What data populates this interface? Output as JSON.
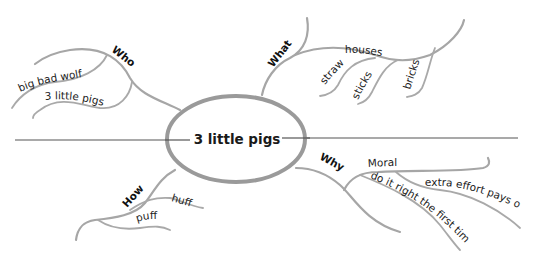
{
  "central_topic": "3 little pigs",
  "colors": {
    "branch": "#a6a6a6",
    "ellipse_stroke": "#9a9a9a",
    "axis_line": "#555555",
    "text": "#1a1a1a"
  },
  "branches": {
    "who": {
      "label": "Who",
      "children": [
        "big bad wolf",
        "3 little pigs"
      ]
    },
    "what": {
      "label": "What",
      "children": [
        {
          "label": "houses",
          "children": [
            "straw",
            "sticks",
            "bricks"
          ]
        }
      ]
    },
    "how": {
      "label": "How",
      "children": [
        "huff",
        "puff"
      ]
    },
    "why": {
      "label": "Why",
      "children": [
        {
          "label": "Moral",
          "children": [
            "extra effort pays off",
            "do it right the first time"
          ]
        }
      ]
    }
  }
}
